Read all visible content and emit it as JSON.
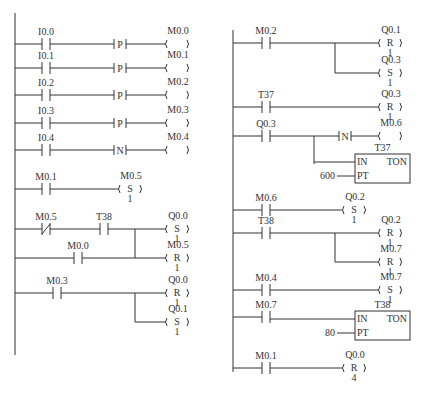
{
  "diagram": {
    "type": "ladder-logic",
    "colors": {
      "line": "#333333",
      "background": "#ffffff"
    },
    "left_network": {
      "rail": {
        "x": 15,
        "y1": 13,
        "y2": 355
      },
      "rungs": [
        {
          "y": 44,
          "elements": [
            {
              "kind": "contact_no",
              "x": 46,
              "label": "I0.0"
            },
            {
              "kind": "edge",
              "x": 120,
              "symbol": "P"
            },
            {
              "kind": "coil",
              "x": 175,
              "label": "M0.0",
              "mode": "",
              "count": ""
            }
          ]
        },
        {
          "y": 68,
          "elements": [
            {
              "kind": "contact_no",
              "x": 46,
              "label": "I0.1"
            },
            {
              "kind": "edge",
              "x": 120,
              "symbol": "P"
            },
            {
              "kind": "coil",
              "x": 175,
              "label": "M0.1",
              "mode": "",
              "count": ""
            }
          ]
        },
        {
          "y": 95,
          "elements": [
            {
              "kind": "contact_no",
              "x": 46,
              "label": "I0.2"
            },
            {
              "kind": "edge",
              "x": 120,
              "symbol": "P"
            },
            {
              "kind": "coil",
              "x": 175,
              "label": "M0.2",
              "mode": "",
              "count": ""
            }
          ]
        },
        {
          "y": 123,
          "elements": [
            {
              "kind": "contact_no",
              "x": 46,
              "label": "I0.3"
            },
            {
              "kind": "edge",
              "x": 120,
              "symbol": "P"
            },
            {
              "kind": "coil",
              "x": 175,
              "label": "M0.3",
              "mode": "",
              "count": ""
            }
          ]
        },
        {
          "y": 150,
          "elements": [
            {
              "kind": "contact_no",
              "x": 46,
              "label": "I0.4"
            },
            {
              "kind": "edge",
              "x": 120,
              "symbol": "N"
            },
            {
              "kind": "coil",
              "x": 175,
              "label": "M0.4",
              "mode": "",
              "count": ""
            }
          ]
        },
        {
          "y": 189,
          "elements": [
            {
              "kind": "contact_no",
              "x": 46,
              "label": "M0.1"
            },
            {
              "kind": "coil",
              "x": 128,
              "label": "M0.5",
              "mode": "S",
              "count": "1"
            }
          ]
        },
        {
          "y": 229,
          "end_x": 135,
          "elements": [
            {
              "kind": "contact_nc",
              "x": 46,
              "label": "M0.5"
            },
            {
              "kind": "contact_no",
              "x": 104,
              "label": "T38"
            },
            {
              "kind": "coil",
              "x": 175,
              "label": "Q0.0",
              "mode": "S",
              "count": "1"
            }
          ]
        },
        {
          "y": 258,
          "branch_from_x": 135,
          "branch_from_y": 229,
          "left_from_rail": true,
          "elements": [
            {
              "kind": "contact_no",
              "x": 78,
              "label": "M0.0"
            },
            {
              "kind": "coil",
              "x": 175,
              "label": "M0.5",
              "mode": "R",
              "count": "1"
            }
          ]
        },
        {
          "y": 293,
          "elements": [
            {
              "kind": "contact_no",
              "x": 57,
              "label": "M0.3"
            },
            {
              "kind": "coil",
              "x": 175,
              "label": "Q0.0",
              "mode": "R",
              "count": "1"
            }
          ]
        },
        {
          "y": 322,
          "branch_from_x": 135,
          "branch_from_y": 293,
          "elements": [
            {
              "kind": "coil",
              "x": 175,
              "label": "Q0.1",
              "mode": "S",
              "count": "1"
            }
          ]
        }
      ]
    },
    "right_network": {
      "rail": {
        "x": 233,
        "y1": 30,
        "y2": 372
      },
      "rungs": [
        {
          "y": 43,
          "elements": [
            {
              "kind": "contact_no",
              "x": 266,
              "label": "M0.2"
            },
            {
              "kind": "coil",
              "x": 388,
              "label": "Q0.1",
              "mode": "R",
              "count": "1"
            }
          ]
        },
        {
          "y": 73,
          "branch_from_x": 335,
          "branch_from_y": 43,
          "elements": [
            {
              "kind": "coil",
              "x": 388,
              "label": "Q0.3",
              "mode": "S",
              "count": "1"
            }
          ]
        },
        {
          "y": 107,
          "elements": [
            {
              "kind": "contact_no",
              "x": 266,
              "label": "T37"
            },
            {
              "kind": "coil",
              "x": 388,
              "label": "Q0.3",
              "mode": "R",
              "count": "1"
            }
          ]
        },
        {
          "y": 136,
          "elements": [
            {
              "kind": "contact_no",
              "x": 266,
              "label": "Q0.3"
            },
            {
              "kind": "edge",
              "x": 345,
              "symbol": "N"
            },
            {
              "kind": "coil",
              "x": 388,
              "label": "M0.6",
              "mode": "",
              "count": ""
            }
          ]
        },
        {
          "y": 164,
          "branch_from_x": 314,
          "branch_from_y": 136,
          "timer": {
            "x": 355,
            "y": 154,
            "w": 55,
            "h": 29,
            "name": "T37",
            "in": "IN",
            "type": "TON",
            "pt_pin": "PT",
            "preset": "600"
          }
        },
        {
          "y": 210,
          "elements": [
            {
              "kind": "contact_no",
              "x": 266,
              "label": "M0.6"
            },
            {
              "kind": "coil",
              "x": 352,
              "label": "Q0.2",
              "mode": "S",
              "count": "1"
            }
          ]
        },
        {
          "y": 233,
          "elements": [
            {
              "kind": "contact_no",
              "x": 266,
              "label": "T38"
            },
            {
              "kind": "coil",
              "x": 388,
              "label": "Q0.2",
              "mode": "R",
              "count": "1"
            }
          ]
        },
        {
          "y": 262,
          "branch_from_x": 335,
          "branch_from_y": 233,
          "elements": [
            {
              "kind": "coil",
              "x": 388,
              "label": "M0.7",
              "mode": "R",
              "count": "1"
            }
          ]
        },
        {
          "y": 290,
          "elements": [
            {
              "kind": "contact_no",
              "x": 266,
              "label": "M0.4"
            },
            {
              "kind": "coil",
              "x": 388,
              "label": "M0.7",
              "mode": "S",
              "count": "1"
            }
          ]
        },
        {
          "y": 317,
          "timer": {
            "x": 355,
            "y": 311,
            "w": 55,
            "h": 29,
            "name": "T38",
            "in": "IN",
            "type": "TON",
            "pt_pin": "PT",
            "preset": "80"
          },
          "elements": [
            {
              "kind": "contact_no",
              "x": 266,
              "label": "M0.7"
            }
          ]
        },
        {
          "y": 368,
          "elements": [
            {
              "kind": "contact_no",
              "x": 266,
              "label": "M0.1"
            },
            {
              "kind": "coil",
              "x": 352,
              "label": "Q0.0",
              "mode": "R",
              "count": "4"
            }
          ]
        }
      ]
    }
  }
}
